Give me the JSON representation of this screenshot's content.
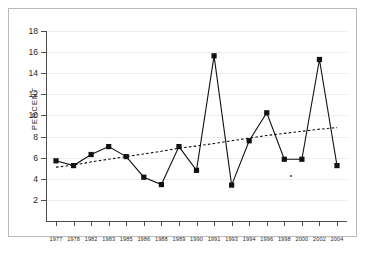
{
  "chart_data": {
    "type": "line",
    "title": "",
    "xlabel": "",
    "ylabel": "PERCENT",
    "ylim": [
      0,
      18
    ],
    "yticks": [
      2,
      4,
      6,
      8,
      10,
      12,
      14,
      16,
      18
    ],
    "grid": true,
    "legend": "none",
    "categories": [
      "1977",
      "1978",
      "1982",
      "1983",
      "1985",
      "1986",
      "1988",
      "1989",
      "1990",
      "1991",
      "1993",
      "1994",
      "1996",
      "1998",
      "2000",
      "2002",
      "2004"
    ],
    "series": [
      {
        "name": "percent",
        "style": "solid-with-square-markers",
        "color": "#111111",
        "values": [
          5.7,
          5.25,
          6.3,
          7.05,
          6.1,
          4.15,
          3.45,
          7.05,
          4.8,
          15.65,
          3.4,
          7.6,
          10.25,
          5.85,
          5.85,
          15.3,
          5.25
        ]
      },
      {
        "name": "trend",
        "style": "dotted-trendline",
        "color": "#111111",
        "values": [
          5.1,
          5.3,
          5.6,
          5.85,
          6.1,
          6.35,
          6.6,
          6.9,
          7.1,
          7.35,
          7.6,
          7.85,
          8.1,
          8.3,
          8.5,
          8.7,
          8.85
        ]
      }
    ]
  },
  "axes": {
    "y_title": "PERCENT",
    "y_tick_labels": [
      "18",
      "16",
      "14",
      "12",
      "10",
      "8",
      "6",
      "4",
      "2"
    ],
    "x_tick_labels": [
      "1977",
      "1978",
      "1982",
      "1983",
      "1985",
      "1986",
      "1988",
      "1989",
      "1990",
      "1991",
      "1993",
      "1994",
      "1996",
      "1998",
      "2000",
      "2002",
      "2004"
    ]
  },
  "colors": {
    "line": "#111111",
    "grid": "#ececec",
    "axis": "#4d4d4d",
    "frame": "#b9b9b9",
    "background": "#ffffff",
    "text": "#262626"
  }
}
